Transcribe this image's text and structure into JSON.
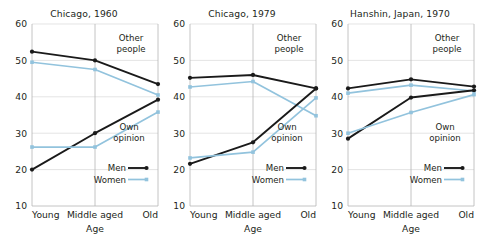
{
  "figure": {
    "background": "#ffffff",
    "series_colors": {
      "men": "#1a1a1a",
      "women": "#92c3dd"
    },
    "grid_color": "#d8d8d8",
    "axis_color": "#b5b5b5"
  },
  "chart_data": [
    {
      "type": "line",
      "title": "Chicago, 1960",
      "xlabel": "Age",
      "ylabel": "",
      "categories": [
        "Young",
        "Middle aged",
        "Old"
      ],
      "ylim": [
        10,
        60
      ],
      "yticks": [
        10,
        20,
        30,
        40,
        50,
        60
      ],
      "grid": true,
      "legend": [
        "Men",
        "Women"
      ],
      "legend_position": "bottom-right",
      "annotations": [
        "Other people",
        "Own opinion"
      ],
      "series": [
        {
          "name": "Men",
          "group": "Other people",
          "values": [
            52.4,
            50.0,
            43.5
          ]
        },
        {
          "name": "Women",
          "group": "Other people",
          "values": [
            49.5,
            47.5,
            40.5
          ]
        },
        {
          "name": "Men",
          "group": "Own opinion",
          "values": [
            20.0,
            30.0,
            39.2
          ]
        },
        {
          "name": "Women",
          "group": "Own opinion",
          "values": [
            26.2,
            26.2,
            35.8
          ]
        }
      ]
    },
    {
      "type": "line",
      "title": "Chicago, 1979",
      "xlabel": "Age",
      "ylabel": "",
      "categories": [
        "Young",
        "Middle aged",
        "Old"
      ],
      "ylim": [
        10,
        60
      ],
      "yticks": [
        10,
        20,
        30,
        40,
        50,
        60
      ],
      "grid": true,
      "legend": [
        "Men",
        "Women"
      ],
      "legend_position": "bottom-right",
      "annotations": [
        "Other people",
        "Own opinion"
      ],
      "series": [
        {
          "name": "Men",
          "group": "Other people",
          "values": [
            45.2,
            46.0,
            42.3
          ]
        },
        {
          "name": "Women",
          "group": "Other people",
          "values": [
            42.7,
            44.2,
            34.8
          ]
        },
        {
          "name": "Men",
          "group": "Own opinion",
          "values": [
            21.6,
            27.5,
            42.3
          ]
        },
        {
          "name": "Women",
          "group": "Own opinion",
          "values": [
            23.2,
            24.8,
            39.7
          ]
        }
      ]
    },
    {
      "type": "line",
      "title": "Hanshin, Japan, 1970",
      "xlabel": "Age",
      "ylabel": "",
      "categories": [
        "Young",
        "Middle aged",
        "Old"
      ],
      "ylim": [
        10,
        60
      ],
      "yticks": [
        10,
        20,
        30,
        40,
        50,
        60
      ],
      "grid": true,
      "legend": [
        "Men",
        "Women"
      ],
      "legend_position": "bottom-right",
      "annotations": [
        "Other people",
        "Own opinion"
      ],
      "series": [
        {
          "name": "Men",
          "group": "Other people",
          "values": [
            42.3,
            44.8,
            42.8
          ]
        },
        {
          "name": "Women",
          "group": "Other people",
          "values": [
            41.0,
            43.2,
            41.6
          ]
        },
        {
          "name": "Men",
          "group": "Own opinion",
          "values": [
            28.5,
            39.8,
            41.8
          ]
        },
        {
          "name": "Women",
          "group": "Own opinion",
          "values": [
            30.0,
            35.7,
            40.6
          ]
        }
      ]
    }
  ]
}
